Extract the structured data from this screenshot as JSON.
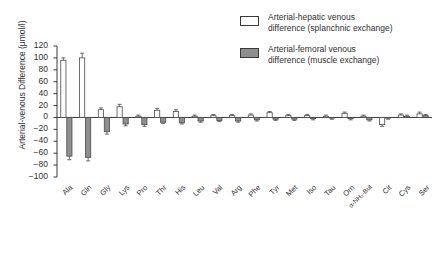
{
  "chart_data": {
    "type": "bar",
    "title": "",
    "xlabel": "",
    "ylabel": "Arterial-venous Difference (μmol/l)",
    "ylim": [
      -100,
      120
    ],
    "ytick_step": 20,
    "grid": false,
    "legend_position": "top-right",
    "categories": [
      "Ala",
      "Gln",
      "Gly",
      "Lys",
      "Pro",
      "Thr",
      "His",
      "Leu",
      "Val",
      "Arg",
      "Phe",
      "Tyr",
      "Met",
      "Iso",
      "Tau",
      "Orn",
      "α-NH₂-But",
      "Cit",
      "Cys",
      "Ser"
    ],
    "yticks": [
      "120",
      "100",
      "80",
      "60",
      "40",
      "20",
      "0",
      "−20",
      "−40",
      "−60",
      "−80",
      "−100"
    ],
    "series": [
      {
        "name": "Arterial-hepatic venous difference (splanchnic exchange)",
        "color": "#ffffff",
        "edge_color": "#4a4a4a",
        "values": [
          96,
          100,
          13,
          18,
          2,
          12,
          10,
          2,
          3,
          3,
          4,
          8,
          3,
          3,
          2,
          7,
          2,
          -12,
          4,
          6
        ],
        "errors": [
          4,
          8,
          3,
          4,
          2,
          3,
          3,
          2,
          2,
          2,
          2,
          2,
          2,
          2,
          2,
          2,
          2,
          3,
          2,
          3
        ]
      },
      {
        "name": "Arterial-femoral venous difference (muscle exchange)",
        "color": "#8f8f8f",
        "edge_color": "#4a4a4a",
        "values": [
          -65,
          -67,
          -24,
          -11,
          -12,
          -8,
          -9,
          -6,
          -5,
          -6,
          -4,
          -3,
          -3,
          -2,
          -1,
          -2,
          -4,
          -1,
          2,
          3
        ],
        "errors": [
          6,
          6,
          4,
          3,
          3,
          2,
          2,
          2,
          2,
          2,
          2,
          2,
          2,
          2,
          2,
          2,
          2,
          2,
          2,
          2
        ]
      }
    ]
  },
  "legend": {
    "items": [
      {
        "swatch": "open",
        "label": "Arterial-hepatic venous\ndifference (splanchnic exchange)"
      },
      {
        "swatch": "filled",
        "label": "Arterial-femoral venous\ndifference (muscle exchange)"
      }
    ]
  }
}
